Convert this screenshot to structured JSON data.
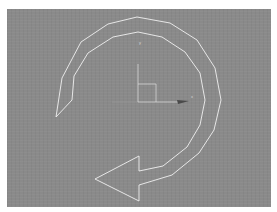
{
  "viewport": {
    "background": "#8a8a8a",
    "spline_color": "#f0f0f0",
    "gizmo_color": "#e0e0e0",
    "arrow_shape": {
      "outer_arc": [
        [
          56,
          117
        ],
        [
          62,
          78
        ],
        [
          81,
          42
        ],
        [
          108,
          24
        ],
        [
          137,
          17
        ],
        [
          170,
          23
        ],
        [
          197,
          40
        ],
        [
          215,
          68
        ],
        [
          221,
          100
        ],
        [
          214,
          130
        ],
        [
          199,
          153
        ],
        [
          172,
          175
        ],
        [
          139,
          185
        ]
      ],
      "arrowhead": [
        [
          139,
          185
        ],
        [
          139,
          201
        ],
        [
          95,
          179
        ],
        [
          139,
          156
        ],
        [
          139,
          171
        ]
      ],
      "inner_arc": [
        [
          139,
          171
        ],
        [
          163,
          166
        ],
        [
          187,
          147
        ],
        [
          200,
          125
        ],
        [
          205,
          100
        ],
        [
          200,
          73
        ],
        [
          185,
          52
        ],
        [
          162,
          37
        ],
        [
          138,
          32
        ],
        [
          113,
          37
        ],
        [
          88,
          53
        ],
        [
          74,
          76
        ],
        [
          72,
          100
        ],
        [
          56,
          117
        ]
      ]
    },
    "gizmo": {
      "y_label": "y",
      "x_label": "x"
    }
  }
}
